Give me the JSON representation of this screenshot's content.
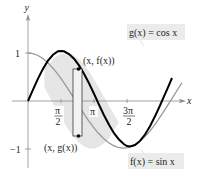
{
  "diagram": {
    "type": "function-graph",
    "axes": {
      "x_label": "x",
      "y_label": "y",
      "y_ticks": [
        "1",
        "−1"
      ],
      "x_ticks": [
        {
          "num": "π",
          "den": "2"
        },
        {
          "num": "π",
          "den": ""
        },
        {
          "num": "3π",
          "den": "2"
        }
      ]
    },
    "curves": [
      {
        "name": "f",
        "label": "f(x) = sin x",
        "label_fn": "f",
        "label_rhs": "sin",
        "color": "#000000",
        "style": "thick"
      },
      {
        "name": "g",
        "label": "g(x) = cos x",
        "label_fn": "g",
        "label_rhs": "cos",
        "color": "#9a9a9a",
        "style": "thin"
      }
    ],
    "shaded_region": {
      "from": "π/4",
      "to": "5π/4",
      "color": "#e6e6e6"
    },
    "representative_rectangle": {
      "top_point_label": "(x, f(x))",
      "bottom_point_label": "(x, g(x))"
    },
    "colors": {
      "axis": "#8c8c8c",
      "sin": "#000000",
      "cos": "#9a9a9a",
      "shade": "#e6e6e6",
      "label_box": "#ebebeb",
      "text": "#231f20"
    }
  }
}
